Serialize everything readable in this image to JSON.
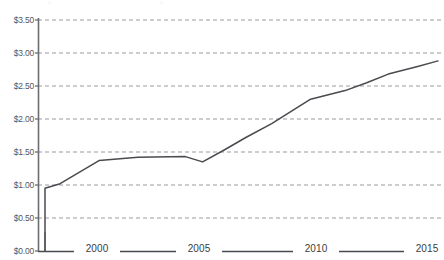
{
  "chart_data": {
    "type": "line",
    "title": "",
    "subtitle": "",
    "xlabel": "",
    "ylabel": "",
    "xlim": [
      1997.7,
      2015.9
    ],
    "ylim": [
      0,
      3.5
    ],
    "grid": true,
    "grid_style": "dashed-horizontal",
    "legend": false,
    "legend_position": "none",
    "axis_line_color": "#6b6c70",
    "series_color": "#4a4b4f",
    "y_ticks": [
      "$0.00",
      "$0.50",
      "$1.00",
      "$1.50",
      "$2.00",
      "$2.50",
      "$3.00",
      "$3.50"
    ],
    "y_tick_values": [
      0,
      0.5,
      1.0,
      1.5,
      2.0,
      2.5,
      3.0,
      3.5
    ],
    "x_ticks": [
      "2000",
      "2005",
      "2010",
      "2015"
    ],
    "x_tick_values": [
      2000,
      2005,
      2010,
      2015
    ],
    "series": [
      {
        "name": "value",
        "x": [
          1997.7,
          1997.7,
          1998.4,
          2000.2,
          2002.0,
          2004.2,
          2005.0,
          2006.0,
          2007.0,
          2008.2,
          2010.0,
          2011.6,
          2012.6,
          2013.6,
          2015.0,
          2015.9
        ],
        "values": [
          0.0,
          0.95,
          1.02,
          1.37,
          1.42,
          1.43,
          1.35,
          1.53,
          1.72,
          1.93,
          2.3,
          2.43,
          2.55,
          2.68,
          2.8,
          2.88
        ]
      }
    ],
    "annotations": []
  },
  "axis": {
    "y_tick_labels": [
      "$3.50",
      "$3.00",
      "$2.50",
      "$2.00",
      "$1.50",
      "$1.00",
      "$0.50",
      "$0.00"
    ],
    "x_tick_labels": [
      "2000",
      "2005",
      "2010",
      "2015"
    ]
  }
}
